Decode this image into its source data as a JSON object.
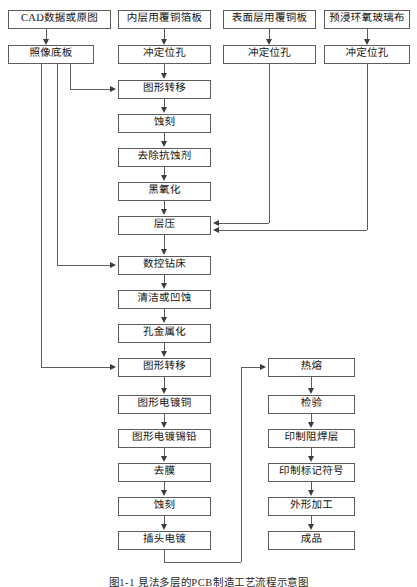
{
  "figure": {
    "caption": "图1-1  見法多层的PCB制造工艺流程示意图",
    "width": 417,
    "height": 587,
    "line_color": "#5d5d5d",
    "arrow_color": "#3c3c3c",
    "background": "#ffffff"
  },
  "inputs": [
    {
      "id": "cad",
      "label": "CAD数据或原图"
    },
    {
      "id": "inner_ccl",
      "label": "内层用覆铜箔板"
    },
    {
      "id": "surf_ccl",
      "label": "表面层用覆铜板"
    },
    {
      "id": "prepreg",
      "label": "预浸环氧玻璃布"
    }
  ],
  "prep": [
    {
      "id": "photo_base",
      "label": "照像底板"
    },
    {
      "id": "punch_inner",
      "label": "冲定位孔"
    },
    {
      "id": "punch_surf",
      "label": "冲定位孔"
    },
    {
      "id": "punch_pre",
      "label": "冲定位孔"
    }
  ],
  "main_column": [
    {
      "id": "pattern_transfer_1",
      "label": "图形转移"
    },
    {
      "id": "etch_1",
      "label": "蚀刻"
    },
    {
      "id": "strip_resist",
      "label": "去除抗蚀剂"
    },
    {
      "id": "black_oxide",
      "label": "黑氧化"
    },
    {
      "id": "lamination",
      "label": "层压"
    },
    {
      "id": "cnc_drill",
      "label": "数控钻床"
    },
    {
      "id": "clean_etchback",
      "label": "清洁或凹蚀"
    },
    {
      "id": "hole_metallize",
      "label": "孔金属化"
    },
    {
      "id": "pattern_transfer_2",
      "label": "图形转移"
    },
    {
      "id": "plate_copper",
      "label": "图形电镀铜"
    },
    {
      "id": "plate_tin_lead",
      "label": "图形电镀锡铅"
    },
    {
      "id": "strip_film",
      "label": "去膜"
    },
    {
      "id": "etch_2",
      "label": "蚀刻"
    },
    {
      "id": "edge_plating",
      "label": "插头电镀"
    }
  ],
  "right_column": [
    {
      "id": "reflow",
      "label": "热熔"
    },
    {
      "id": "inspect",
      "label": "检验"
    },
    {
      "id": "solder_mask",
      "label": "印制阻焊层"
    },
    {
      "id": "legend_print",
      "label": "印制标记符号"
    },
    {
      "id": "profiling",
      "label": "外形加工"
    },
    {
      "id": "finished",
      "label": "成品"
    }
  ]
}
